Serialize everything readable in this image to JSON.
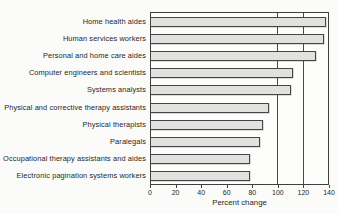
{
  "chart_data": {
    "type": "bar",
    "orientation": "horizontal",
    "title": "",
    "xlabel": "Percent change",
    "ylabel": "",
    "categories": [
      "Home health aides",
      "Human services workers",
      "Personal and home care aides",
      "Computer engineers and scientists",
      "Systems analysts",
      "Physical and corrective therapy assistants",
      "Physical therapists",
      "Paralegals",
      "Occupational therapy assistants and aides",
      "Electronic pagination systems workers"
    ],
    "values": [
      138,
      136,
      130,
      112,
      110,
      93,
      88,
      86,
      78,
      78
    ],
    "xlim": [
      0,
      140
    ],
    "xticks": [
      0,
      20,
      40,
      60,
      80,
      100,
      120,
      140
    ],
    "gridlines_x": [
      100,
      120
    ],
    "legend": "none",
    "colors": {
      "bar_fill": "#e1e1e0",
      "bar_border": "#454545",
      "frame": "#3f3f3f",
      "text": "#262626",
      "background": "#fbfbfa"
    }
  }
}
